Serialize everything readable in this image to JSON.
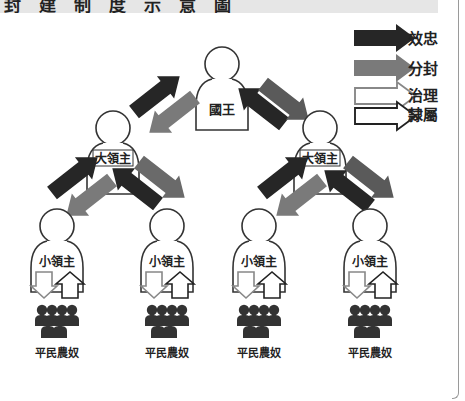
{
  "title": "封建制度示意圖",
  "colors": {
    "loyalty_arrow": "#2b2b2b",
    "fief_arrow": "#7a7a7a",
    "outline": "#333333",
    "title_band": "#e6e6e6",
    "border": "#9a9a9a"
  },
  "legend": {
    "items": [
      {
        "label": "效忠",
        "style": "solid-black-arrow"
      },
      {
        "label": "分封",
        "style": "solid-gray-arrow"
      },
      {
        "label": "治理",
        "style": "outline-gray-arrow"
      },
      {
        "label": "隸屬",
        "style": "outline-black-arrow"
      }
    ]
  },
  "nodes": {
    "king": {
      "label": "國王"
    },
    "great_lord_left": {
      "label": "大領主"
    },
    "great_lord_right": {
      "label": "大領主"
    },
    "lesser_lords": [
      {
        "label": "小領主"
      },
      {
        "label": "小領主"
      },
      {
        "label": "小領主"
      },
      {
        "label": "小領主"
      }
    ],
    "commoners": [
      {
        "label": "平民農奴"
      },
      {
        "label": "平民農奴"
      },
      {
        "label": "平民農奴"
      },
      {
        "label": "平民農奴"
      }
    ]
  }
}
